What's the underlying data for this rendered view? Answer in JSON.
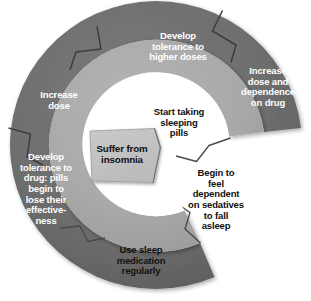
{
  "diagram": {
    "type": "spiral-cycle",
    "colors": {
      "outer_band": "#6e6e6e",
      "outer_band_dark": "#5d5d5d",
      "inner_band": "#a9a9a9",
      "core_box": "#c3c3c3",
      "background": "#ffffff",
      "outer_text": "#ffffff",
      "inner_text": "#101010",
      "divider": "#3a3a3a"
    },
    "segments": [
      {
        "id": "suffer-from-insomnia",
        "order": 1,
        "band": "core",
        "text": "Suffer from\ninsomnia",
        "text_color": "#101010"
      },
      {
        "id": "start-taking-sleeping-pills",
        "order": 2,
        "band": "inner",
        "text": "Start taking\nsleeping\npills",
        "text_color": "#101010"
      },
      {
        "id": "begin-to-feel-dependent",
        "order": 3,
        "band": "inner",
        "text": "Begin to\nfeel\ndependent\non sedatives\nto fall\nasleep",
        "text_color": "#101010"
      },
      {
        "id": "use-sleep-medication-regularly",
        "order": 4,
        "band": "inner",
        "text": "Use sleep\nmedication\nregularly",
        "text_color": "#101010"
      },
      {
        "id": "develop-tolerance-to-drug",
        "order": 5,
        "band": "outer",
        "text": "Develop\ntolerance to\ndrug: pills\nbegin to\nlose their\neffective-\nness",
        "text_color": "#ffffff"
      },
      {
        "id": "increase-dose",
        "order": 6,
        "band": "outer",
        "text": "Increase\ndose",
        "text_color": "#ffffff"
      },
      {
        "id": "develop-tolerance-to-higher-doses",
        "order": 7,
        "band": "outer",
        "text": "Develop\ntolerance to\nhigher doses",
        "text_color": "#ffffff"
      },
      {
        "id": "increase-dose-and-dependence",
        "order": 8,
        "band": "outer",
        "text": "Increase\ndose and\ndependence\non drug",
        "text_color": "#ffffff"
      }
    ]
  }
}
